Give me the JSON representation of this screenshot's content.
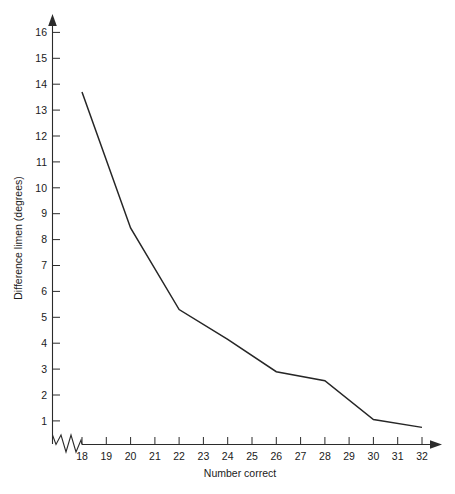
{
  "chart_data": {
    "type": "line",
    "title": "",
    "xlabel": "Number correct",
    "ylabel": "Difference limen (degrees)",
    "x": [
      18,
      20,
      22,
      24,
      26,
      28,
      30,
      32
    ],
    "values": [
      13.7,
      8.45,
      5.3,
      4.15,
      2.9,
      2.55,
      1.05,
      0.75
    ],
    "series": [
      {
        "name": "Difference limen",
        "values": [
          13.7,
          8.45,
          5.3,
          4.15,
          2.9,
          2.55,
          1.05,
          0.75
        ]
      }
    ],
    "xlim": [
      18,
      32
    ],
    "ylim": [
      0,
      16.4
    ],
    "xticks": [
      18,
      19,
      20,
      21,
      22,
      23,
      24,
      25,
      26,
      27,
      28,
      29,
      30,
      31,
      32
    ],
    "xtick_labels": [
      "18",
      "19",
      "20",
      "21",
      "22",
      "23",
      "24",
      "25",
      "26",
      "27",
      "28",
      "29",
      "30",
      "31",
      "32"
    ],
    "yticks": [
      1,
      2,
      3,
      4,
      5,
      6,
      7,
      8,
      9,
      10,
      11,
      12,
      13,
      14,
      15,
      16
    ],
    "ytick_labels": [
      "1",
      "2",
      "3",
      "4",
      "5",
      "6",
      "7",
      "8",
      "9",
      "10",
      "11",
      "12",
      "13",
      "14",
      "15",
      "16"
    ],
    "grid": false,
    "legend": false,
    "legend_position": "none",
    "y_axis_break": true,
    "x_axis_arrow": true,
    "y_axis_arrow": true,
    "line_color": "#262626",
    "axis_color": "#2b2b2b",
    "background_color": "#ffffff"
  }
}
